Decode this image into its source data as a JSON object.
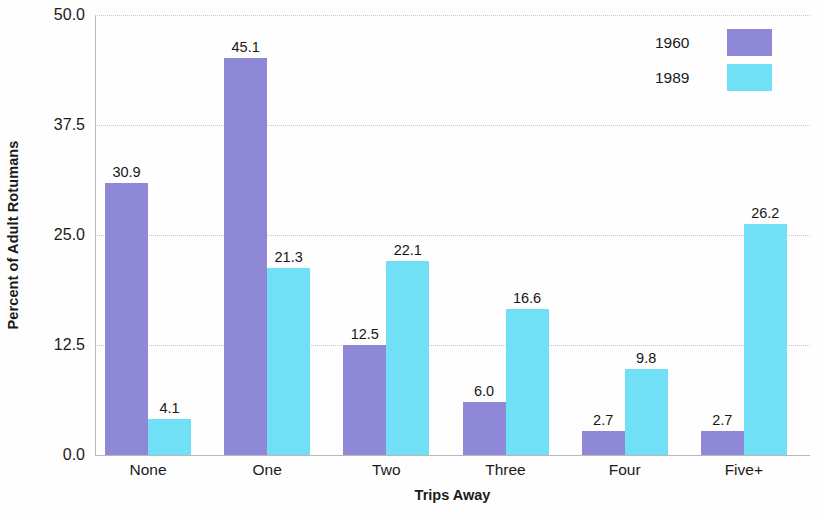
{
  "chart_data": {
    "type": "bar",
    "title": "",
    "xlabel": "Trips Away",
    "ylabel": "Percent of Adult Rotumans",
    "categories": [
      "None",
      "One",
      "Two",
      "Three",
      "Four",
      "Five+"
    ],
    "series": [
      {
        "name": "1960",
        "color": "#8e88d7",
        "values": [
          30.9,
          45.1,
          12.5,
          6.0,
          2.7,
          2.7
        ]
      },
      {
        "name": "1989",
        "color": "#71e0f6",
        "values": [
          4.1,
          21.3,
          22.1,
          16.6,
          9.8,
          26.2
        ]
      }
    ],
    "value_labels": [
      [
        "30.9",
        "45.1",
        "12.5",
        "6.0",
        "2.7",
        "2.7"
      ],
      [
        "4.1",
        "21.3",
        "22.1",
        "16.6",
        "9.8",
        "26.2"
      ]
    ],
    "ylim": [
      0,
      50
    ],
    "yticks": [
      0,
      12.5,
      25,
      37.5,
      50
    ],
    "ytick_labels": [
      "0.0",
      "12.5",
      "25.0",
      "37.5",
      "50.0"
    ],
    "grid": true,
    "legend": {
      "position": "top-right",
      "entries": [
        {
          "label": "1960",
          "color": "#8e88d7"
        },
        {
          "label": "1989",
          "color": "#71e0f6"
        }
      ]
    }
  }
}
